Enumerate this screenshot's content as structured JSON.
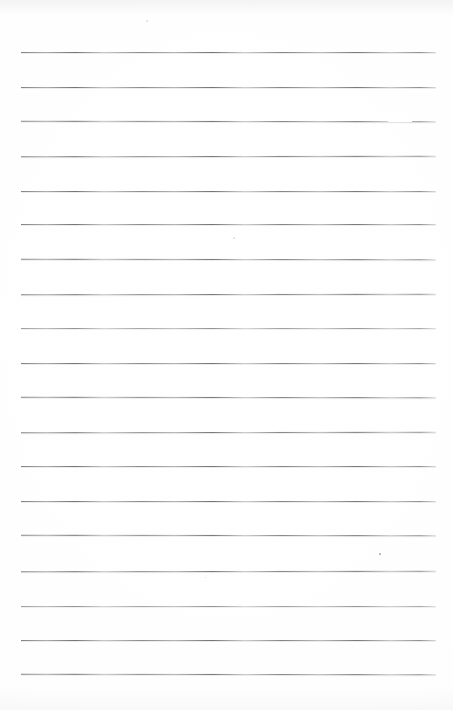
{
  "document": {
    "kind": "scanned-lined-notebook-page",
    "title": "Blank ruled notebook page",
    "content_text": "",
    "width_px": 453,
    "height_px": 710,
    "paper_color": "#ffffff",
    "rule_color": "#7a7a7a",
    "rule_count": 19,
    "rule_left_px": 21,
    "rule_right_px": 436,
    "rule_spacing_px": 34.6,
    "first_rule_y_px": 51.7,
    "orientation": "portrait",
    "has_margin_rule": false,
    "has_handwriting": false
  },
  "rules": [
    {
      "index": 1,
      "y": 51.7,
      "left": 21,
      "width": 415,
      "opacity": "normal"
    },
    {
      "index": 2,
      "y": 86.5,
      "left": 21,
      "width": 415,
      "opacity": "normal"
    },
    {
      "index": 3,
      "y": 121.0,
      "left": 21,
      "width": 415,
      "opacity": "normal"
    },
    {
      "index": 4,
      "y": 155.8,
      "left": 21,
      "width": 415,
      "opacity": "normal"
    },
    {
      "index": 5,
      "y": 190.5,
      "left": 21,
      "width": 415,
      "opacity": "normal"
    },
    {
      "index": 6,
      "y": 224.0,
      "left": 21,
      "width": 415,
      "opacity": "normal"
    },
    {
      "index": 7,
      "y": 258.5,
      "left": 21,
      "width": 415,
      "opacity": "normal"
    },
    {
      "index": 8,
      "y": 293.5,
      "left": 21,
      "width": 415,
      "opacity": "normal"
    },
    {
      "index": 9,
      "y": 327.5,
      "left": 21,
      "width": 415,
      "opacity": "light"
    },
    {
      "index": 10,
      "y": 362.5,
      "left": 21,
      "width": 415,
      "opacity": "normal"
    },
    {
      "index": 11,
      "y": 397.0,
      "left": 21,
      "width": 415,
      "opacity": "normal"
    },
    {
      "index": 12,
      "y": 431.7,
      "left": 21,
      "width": 415,
      "opacity": "normal"
    },
    {
      "index": 13,
      "y": 466.0,
      "left": 21,
      "width": 415,
      "opacity": "normal"
    },
    {
      "index": 14,
      "y": 501.0,
      "left": 21,
      "width": 415,
      "opacity": "normal"
    },
    {
      "index": 15,
      "y": 535.3,
      "left": 21,
      "width": 415,
      "opacity": "normal"
    },
    {
      "index": 16,
      "y": 570.7,
      "left": 21,
      "width": 415,
      "opacity": "normal"
    },
    {
      "index": 17,
      "y": 605.7,
      "left": 21,
      "width": 415,
      "opacity": "light"
    },
    {
      "index": 18,
      "y": 640.0,
      "left": 21,
      "width": 415,
      "opacity": "normal"
    },
    {
      "index": 19,
      "y": 674.0,
      "left": 21,
      "width": 415,
      "opacity": "normal"
    }
  ],
  "artifacts": {
    "line3_dropout": {
      "x": 388,
      "y": 119,
      "width": 24
    },
    "specks": [
      {
        "name": "speck-upper-left",
        "x": 146,
        "y": 20,
        "size": 2,
        "faint": true
      },
      {
        "name": "speck-mid-page",
        "x": 233,
        "y": 237,
        "size": 2,
        "faint": true
      },
      {
        "name": "speck-lower-right",
        "x": 379,
        "y": 553,
        "size": 2,
        "faint": false
      },
      {
        "name": "speck-mid-right",
        "x": 205,
        "y": 577,
        "size": 1,
        "faint": true
      }
    ]
  }
}
